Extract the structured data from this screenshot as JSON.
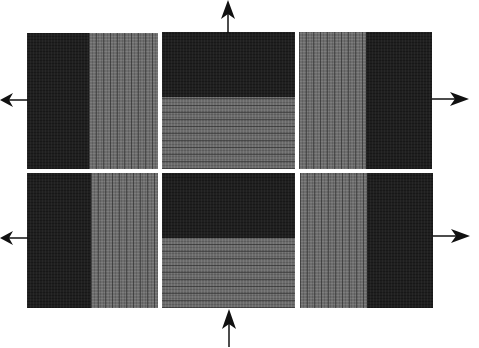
{
  "diagram": {
    "colors": {
      "background": "#ffffff",
      "dark_yarn": "#1f1f1f",
      "light_yarn": "#6e6e6e",
      "arrow": "#111111"
    },
    "panels": [
      {
        "id": "top-left",
        "dark_side": "left",
        "stripes": "vertical"
      },
      {
        "id": "top-middle",
        "dark_side": "top",
        "stripes": "horizontal"
      },
      {
        "id": "top-right",
        "dark_side": "right",
        "stripes": "vertical"
      },
      {
        "id": "bottom-left",
        "dark_side": "left",
        "stripes": "vertical"
      },
      {
        "id": "bottom-middle",
        "dark_side": "top",
        "stripes": "horizontal"
      },
      {
        "id": "bottom-right",
        "dark_side": "right",
        "stripes": "vertical"
      }
    ],
    "arrows": [
      {
        "id": "arrow-top",
        "direction": "up"
      },
      {
        "id": "arrow-bottom",
        "direction": "up"
      },
      {
        "id": "arrow-left-top",
        "direction": "left"
      },
      {
        "id": "arrow-left-bottom",
        "direction": "left"
      },
      {
        "id": "arrow-right-top",
        "direction": "right"
      },
      {
        "id": "arrow-right-bottom",
        "direction": "right"
      }
    ]
  }
}
